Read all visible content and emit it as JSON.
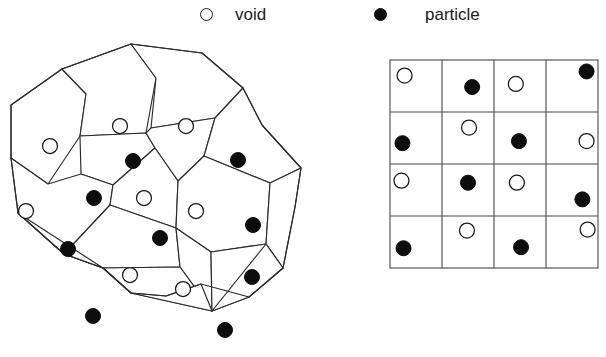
{
  "figure": {
    "colors": {
      "void_fill": "#ffffff",
      "void_stroke": "#1a1a1a",
      "particle_fill": "#0d0d0d",
      "cell_stroke": "#2b2b2b",
      "grid_stroke": "#4a4a4a",
      "background": "#ffffff"
    }
  },
  "legend": {
    "entries": [
      {
        "key": "void",
        "label": "void",
        "marker": "open-circle"
      },
      {
        "key": "particle",
        "label": "particle",
        "marker": "filled-circle"
      }
    ],
    "void_label": "void",
    "particle_label": "particle"
  },
  "chart_data": {
    "type": "scatter",
    "title": "",
    "xlabel": "",
    "ylabel": "",
    "legend": [
      "void",
      "particle"
    ],
    "legend_position": "top",
    "grid": false,
    "panels": [
      {
        "name": "disordered-cells",
        "description": "Irregular Voronoi-like tessellation of 17 convex cells, each containing one site",
        "cell_count": 17,
        "void_count": 8,
        "particle_count": 9,
        "outline": [
          [
            11,
            67
          ],
          [
            62,
            31
          ],
          [
            131,
            6
          ],
          [
            202,
            15
          ],
          [
            243,
            50
          ],
          [
            262,
            87
          ],
          [
            301,
            130
          ],
          [
            295,
            169
          ],
          [
            283,
            230
          ],
          [
            249,
            259
          ],
          [
            201,
            246
          ],
          [
            166,
            258
          ],
          [
            131,
            255
          ],
          [
            103,
            230
          ],
          [
            64,
            216
          ],
          [
            18,
            175
          ],
          [
            11,
            120
          ]
        ],
        "sites": [
          {
            "id": 1,
            "type": "void",
            "x": 50,
            "y": 108
          },
          {
            "id": 2,
            "type": "void",
            "x": 120,
            "y": 88
          },
          {
            "id": 3,
            "type": "void",
            "x": 186,
            "y": 88
          },
          {
            "id": 4,
            "type": "void",
            "x": 26,
            "y": 173
          },
          {
            "id": 5,
            "type": "void",
            "x": 144,
            "y": 160
          },
          {
            "id": 6,
            "type": "void",
            "x": 196,
            "y": 173
          },
          {
            "id": 7,
            "type": "void",
            "x": 130,
            "y": 237
          },
          {
            "id": 8,
            "type": "void",
            "x": 183,
            "y": 251
          },
          {
            "id": 9,
            "type": "particle",
            "x": 133,
            "y": 123
          },
          {
            "id": 10,
            "type": "particle",
            "x": 238,
            "y": 122
          },
          {
            "id": 11,
            "type": "particle",
            "x": 94,
            "y": 160
          },
          {
            "id": 12,
            "type": "particle",
            "x": 253,
            "y": 187
          },
          {
            "id": 13,
            "type": "particle",
            "x": 160,
            "y": 200
          },
          {
            "id": 14,
            "type": "particle",
            "x": 68,
            "y": 211
          },
          {
            "id": 15,
            "type": "particle",
            "x": 252,
            "y": 239
          },
          {
            "id": 16,
            "type": "particle",
            "x": 93,
            "y": 278
          },
          {
            "id": 17,
            "type": "particle",
            "x": 225,
            "y": 292
          }
        ]
      },
      {
        "name": "regular-lattice",
        "description": "Regular 4x4 square lattice, alternating void and particle occupancy",
        "rows": 4,
        "cols": 4,
        "cell_size_px": 52,
        "void_count": 8,
        "particle_count": 8,
        "occupancy": [
          [
            "void",
            "particle",
            "void",
            "particle"
          ],
          [
            "particle",
            "void",
            "particle",
            "void"
          ],
          [
            "void",
            "particle",
            "void",
            "particle"
          ],
          [
            "particle",
            "void",
            "particle",
            "void"
          ]
        ],
        "marker_offsets": [
          [
            [
              0.28,
              0.3
            ],
            [
              0.58,
              0.52
            ],
            [
              0.42,
              0.46
            ],
            [
              0.78,
              0.22
            ]
          ],
          [
            [
              0.24,
              0.6
            ],
            [
              0.52,
              0.3
            ],
            [
              0.48,
              0.56
            ],
            [
              0.78,
              0.56
            ]
          ],
          [
            [
              0.22,
              0.32
            ],
            [
              0.5,
              0.36
            ],
            [
              0.44,
              0.36
            ],
            [
              0.7,
              0.68
            ]
          ],
          [
            [
              0.26,
              0.62
            ],
            [
              0.48,
              0.28
            ],
            [
              0.52,
              0.6
            ],
            [
              0.8,
              0.26
            ]
          ]
        ]
      }
    ]
  }
}
